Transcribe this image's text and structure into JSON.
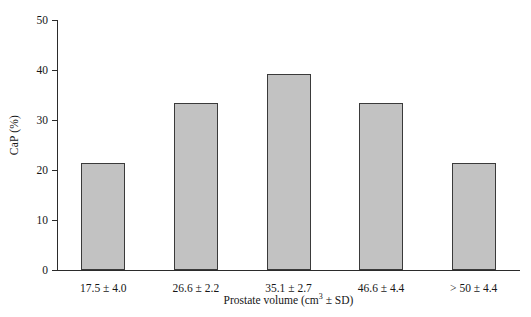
{
  "chart_data": {
    "type": "bar",
    "title": "",
    "xlabel": "Prostate volume (cm³ ± SD)",
    "xlabel_prefix": "Prostate volume (cm",
    "xlabel_exponent": "3",
    "xlabel_suffix": " ± SD)",
    "ylabel": "CaP (%)",
    "categories": [
      "17.5 ± 4.0",
      "26.6 ± 2.2",
      "35.1 ± 2.7",
      "46.6 ± 4.4",
      "> 50 ± 4.4"
    ],
    "values": [
      21.4,
      33.4,
      39.2,
      33.4,
      21.4
    ],
    "ylim": [
      0,
      50
    ],
    "yticks": [
      0,
      10,
      20,
      30,
      40,
      50
    ],
    "ytick_labels": [
      "0",
      "10",
      "20",
      "30",
      "40",
      "50"
    ],
    "grid": false,
    "legend": false,
    "bar_fill_color": "#c2c2c2",
    "bar_edge_color": "#3a3a3a",
    "axis_color": "#2b2b2b",
    "background_color": "#ffffff"
  }
}
